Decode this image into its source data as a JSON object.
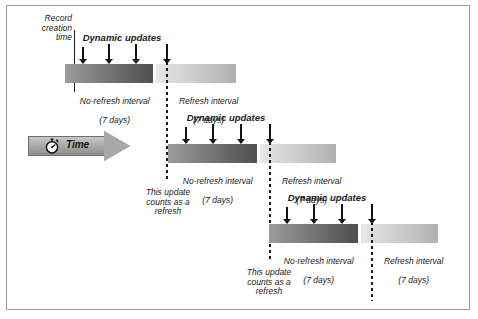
{
  "diagram": {
    "time_axis": {
      "label": "Time",
      "icon": "stopwatch-icon",
      "direction": "left-to-right"
    },
    "record_creation": {
      "label": "Record\ncreation\ntime"
    },
    "labels": {
      "dynamic_updates": "Dynamic updates",
      "no_refresh_interval": "No-refresh interval",
      "refresh_interval": "Refresh interval",
      "duration": "(7 days)",
      "counts_as_refresh": "This update\ncounts as a\nrefresh"
    },
    "colors": {
      "no_refresh_start": "#9c9c9c",
      "no_refresh_end": "#4f4f4f",
      "refresh_start": "#e8e8e8",
      "refresh_end": "#b0b0b0",
      "arrow_fill": "#111111",
      "frame_border": "#9a9a9a",
      "time_arrow_fill": "#a8a8a8",
      "background": "#ffffff"
    },
    "rows": [
      {
        "id": "row-1",
        "no_refresh_label": "No-refresh interval",
        "no_refresh_duration": "(7 days)",
        "refresh_label": "Refresh interval",
        "refresh_duration": "(7 days)",
        "dynamic_updates_label": "Dynamic updates",
        "update_arrows": 3,
        "refresh_arrow": 1,
        "start_marker": "solid-line",
        "start_marker_label": "Record creation time",
        "end_marker": "dashed-line"
      },
      {
        "id": "row-2",
        "no_refresh_label": "No-refresh interval",
        "no_refresh_duration": "(7 days)",
        "refresh_label": "Refresh interval",
        "refresh_duration": "(7 days)",
        "dynamic_updates_label": "Dynamic updates",
        "update_arrows": 3,
        "refresh_arrow": 1,
        "start_marker": "dashed-line",
        "start_marker_label": "This update counts as a refresh",
        "end_marker": "dashed-line"
      },
      {
        "id": "row-3",
        "no_refresh_label": "No-refresh interval",
        "no_refresh_duration": "(7 days)",
        "refresh_label": "Refresh interval",
        "refresh_duration": "(7 days)",
        "dynamic_updates_label": "Dynamic updates",
        "update_arrows": 3,
        "refresh_arrow": 1,
        "start_marker": "dashed-line",
        "start_marker_label": "This update counts as a refresh",
        "end_marker": "dashed-line"
      }
    ]
  }
}
